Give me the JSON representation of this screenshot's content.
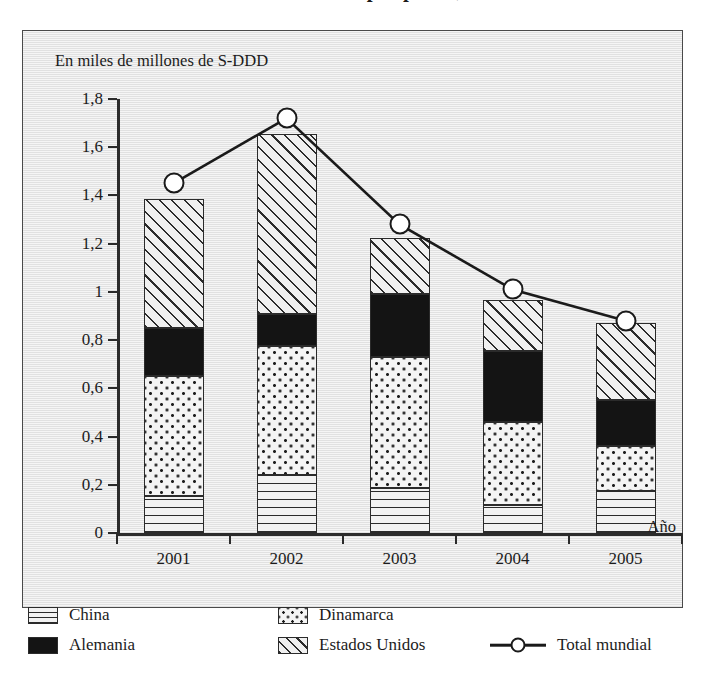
{
  "title": "Consumo de estimulantes por países, 2001 a 2005",
  "panel": {
    "axis_caption": "En miles de millones de S-DDD",
    "x_axis_title": "Año"
  },
  "legend": {
    "items": [
      {
        "key": "china",
        "label": "China",
        "pattern": "horizontal-lines"
      },
      {
        "key": "dinamarca",
        "label": "Dinamarca",
        "pattern": "dots"
      },
      {
        "key": "alemania",
        "label": "Alemania",
        "pattern": "solid-black"
      },
      {
        "key": "eeuu",
        "label": "Estados Unidos",
        "pattern": "diagonal-hatch"
      },
      {
        "key": "total",
        "label": "Total mundial",
        "pattern": "line-with-circle-marker"
      }
    ]
  },
  "chart_data": {
    "type": "bar",
    "subtype": "stacked-bar-with-line-overlay",
    "title": "Consumo de estimulantes por países, 2001 a 2005",
    "xlabel": "Año",
    "ylabel": "En miles de millones de S-DDD",
    "categories": [
      "2001",
      "2002",
      "2003",
      "2004",
      "2005"
    ],
    "ylim": [
      0,
      1.8
    ],
    "ytick_labels": [
      "0",
      "0,2",
      "0,4",
      "0,6",
      "0,8",
      "1",
      "1,2",
      "1,4",
      "1,6",
      "1,8"
    ],
    "ytick_values": [
      0,
      0.2,
      0.4,
      0.6,
      0.8,
      1.0,
      1.2,
      1.4,
      1.6,
      1.8
    ],
    "grid": false,
    "legend_position": "bottom",
    "stack_order": [
      "China",
      "Dinamarca",
      "Alemania",
      "Estados Unidos"
    ],
    "series": [
      {
        "name": "China",
        "values": [
          0.155,
          0.24,
          0.185,
          0.115,
          0.175
        ]
      },
      {
        "name": "Dinamarca",
        "values": [
          0.495,
          0.535,
          0.545,
          0.345,
          0.185
        ]
      },
      {
        "name": "Alemania",
        "values": [
          0.2,
          0.135,
          0.26,
          0.295,
          0.19
        ]
      },
      {
        "name": "Estados Unidos",
        "values": [
          0.535,
          0.745,
          0.235,
          0.21,
          0.32
        ]
      }
    ],
    "cumulative_tops": {
      "China": [
        0.155,
        0.24,
        0.185,
        0.115,
        0.175
      ],
      "Dinamarca": [
        0.65,
        0.775,
        0.73,
        0.46,
        0.36
      ],
      "Alemania": [
        0.85,
        0.91,
        0.99,
        0.755,
        0.55
      ],
      "Estados Unidos": [
        1.385,
        1.655,
        1.225,
        0.965,
        0.87
      ]
    },
    "overlay_line": {
      "name": "Total mundial",
      "values": [
        1.45,
        1.72,
        1.28,
        1.01,
        0.88
      ],
      "marker": "open-circle"
    }
  },
  "colors": {
    "panel_background": "#e9e9e9",
    "ink": "#2b2b2b",
    "alemania_fill": "#141414",
    "marker_fill": "#ffffff"
  }
}
